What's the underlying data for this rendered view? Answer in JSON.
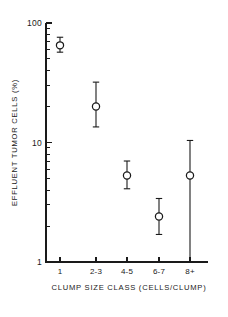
{
  "chart_data": {
    "type": "scatter",
    "title": "",
    "xlabel": "CLUMP SIZE CLASS (CELLS/CLUMP)",
    "ylabel": "EFFLUENT TUMOR CELLS (%)",
    "yscale": "log",
    "ylim": [
      1,
      100
    ],
    "ytick_labels": [
      "100",
      "10",
      "1"
    ],
    "ytick_values": [
      100,
      10,
      1
    ],
    "y_minor_ticks": [
      90,
      80,
      70,
      60,
      50,
      40,
      30,
      20,
      9,
      8,
      7,
      6,
      5,
      4,
      3,
      2
    ],
    "categories": [
      "1",
      "2-3",
      "4-5",
      "6-7",
      "8+"
    ],
    "grid": false,
    "legend": false,
    "marker": "open-circle",
    "error_style": "capped-vertical",
    "series": [
      {
        "name": "Effluent tumor cells",
        "values": [
          65,
          20,
          5.3,
          2.4,
          5.3
        ],
        "err_low": [
          57,
          13.5,
          4.1,
          1.7,
          1.0
        ],
        "err_high": [
          76,
          32,
          7.0,
          3.4,
          10.4
        ]
      }
    ],
    "points": [
      {
        "category": "1",
        "value": 65,
        "low": 57,
        "high": 76
      },
      {
        "category": "2-3",
        "value": 20,
        "low": 13.5,
        "high": 32
      },
      {
        "category": "4-5",
        "value": 5.3,
        "low": 4.1,
        "high": 7.0
      },
      {
        "category": "6-7",
        "value": 2.4,
        "low": 1.7,
        "high": 3.4
      },
      {
        "category": "8+",
        "value": 5.3,
        "low": 1.0,
        "high": 10.4
      }
    ]
  }
}
